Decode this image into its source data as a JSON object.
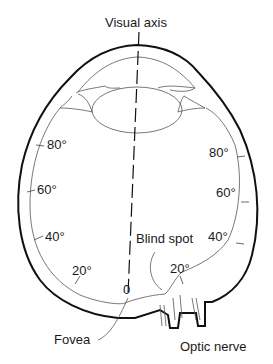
{
  "diagram": {
    "title": "Visual axis",
    "labels": {
      "visual_axis": "Visual axis",
      "blind_spot": "Blind spot",
      "fovea": "Fovea",
      "optic_nerve": "Optic nerve",
      "zero": "0"
    },
    "left_degrees": [
      "80°",
      "60°",
      "40°",
      "20°"
    ],
    "right_degrees": [
      "80°",
      "60°",
      "40°",
      "20°"
    ]
  }
}
